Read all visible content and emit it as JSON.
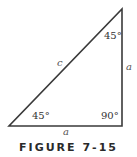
{
  "figure": {
    "caption": "FIGURE 7-15",
    "stroke_color": "#3a3a3a",
    "triangle": {
      "type": "right isosceles triangle",
      "vertices": {
        "bottom_left": [
          9,
          126
        ],
        "bottom_right": [
          122,
          126
        ],
        "top": [
          122,
          9
        ]
      }
    },
    "angles": {
      "top": "45°",
      "bottom_left": "45°",
      "bottom_right": "90°"
    },
    "sides": {
      "hypotenuse": "c",
      "vertical_leg": "a",
      "horizontal_leg": "a"
    }
  }
}
